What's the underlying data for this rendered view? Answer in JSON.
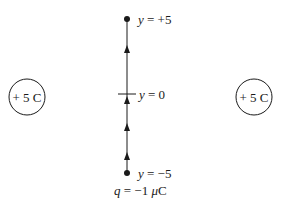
{
  "diagram": {
    "left_charge": {
      "label": "+ 5 C",
      "value": "+5 C"
    },
    "right_charge": {
      "label": "+ 5 C",
      "value": "+5 C"
    },
    "path_points": {
      "top": {
        "var": "y",
        "eq": " = +5"
      },
      "middle": {
        "var": "y",
        "eq": " = 0"
      },
      "bottom": {
        "var": "y",
        "eq": " = −5"
      }
    },
    "test_charge": {
      "var": "q",
      "eq": " = −1 ",
      "unit_mu": "μ",
      "unit": "C"
    },
    "arrow_direction": "up",
    "colors": {
      "line": "#1a1a1a",
      "background": "#ffffff"
    }
  }
}
